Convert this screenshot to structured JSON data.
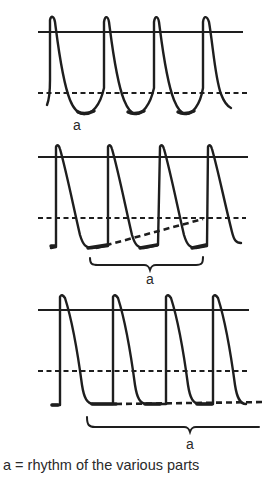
{
  "diagram": {
    "panels": [
      {
        "id": "panel-1",
        "label": "a",
        "description": "rounded potentials with deep troughs below dashed threshold line",
        "peaks_x": [
          51,
          105,
          156,
          205
        ]
      },
      {
        "id": "panel-2",
        "label": "a",
        "description": "potentials with slow diastolic depolarization ramp (sloped dashed line) and brace",
        "peaks_x": [
          57,
          110,
          162,
          210
        ]
      },
      {
        "id": "panel-3",
        "label": "a",
        "description": "potentials with flat resting baseline (horizontal dashed line) and long brace",
        "peaks_x": [
          62,
          115,
          168,
          213
        ]
      }
    ],
    "caption": "a = rhythm of the  various parts"
  }
}
